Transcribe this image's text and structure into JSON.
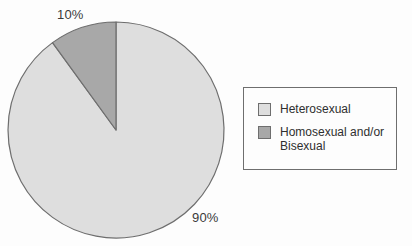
{
  "chart_data": {
    "type": "pie",
    "title": "",
    "categories": [
      "Heterosexual",
      "Homosexual and/or Bisexual"
    ],
    "values": [
      90,
      10
    ],
    "unit": "%",
    "data_labels": [
      "90%",
      "10%"
    ],
    "colors": [
      "#dedede",
      "#a8a8a8"
    ],
    "legend_position": "right",
    "grid": false,
    "start_angle_deg": 90,
    "direction": "counterclockwise"
  },
  "pie": {
    "slices": [
      {
        "label": "Heterosexual",
        "value": 90,
        "data_label": "90%",
        "color": "#dedede"
      },
      {
        "label": "Homosexual and/or Bisexual",
        "value": 10,
        "data_label": "10%",
        "color": "#a8a8a8"
      }
    ],
    "outline_color": "#6e6e6e"
  },
  "labels": {
    "minor": "10%",
    "major": "90%"
  },
  "legend": {
    "border_color": "#6e6e6e",
    "items": [
      {
        "label": "Heterosexual",
        "color": "#dedede"
      },
      {
        "label": "Homosexual and/or\nBisexual",
        "color": "#a8a8a8"
      }
    ]
  }
}
